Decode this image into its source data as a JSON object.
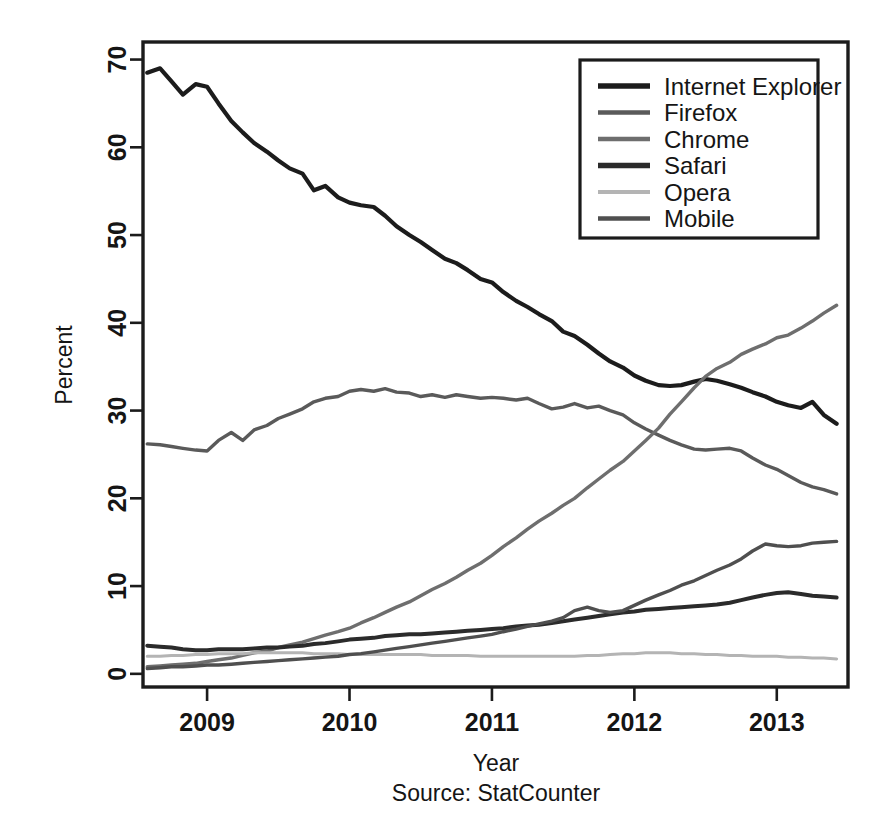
{
  "figure": {
    "source_note": "Source: StatCounter",
    "x_axis_title": "Year",
    "y_axis_title": "Percent"
  },
  "chart_data": {
    "type": "line",
    "title": "",
    "xlabel": "Year",
    "ylabel": "Percent",
    "subtitle": "Source: StatCounter",
    "xlim": [
      2008.55,
      2013.5
    ],
    "ylim": [
      -1.5,
      72
    ],
    "xticks": [
      2009,
      2010,
      2011,
      2012,
      2013
    ],
    "xticklabels": [
      "2009",
      "2010",
      "2011",
      "2012",
      "2013"
    ],
    "yticks": [
      0,
      10,
      20,
      30,
      40,
      50,
      60,
      70
    ],
    "yticklabels": [
      "0",
      "10",
      "20",
      "30",
      "40",
      "50",
      "60",
      "70"
    ],
    "grid": false,
    "legend_position": "top-right",
    "x": [
      2008.58,
      2008.67,
      2008.75,
      2008.83,
      2008.92,
      2009.0,
      2009.08,
      2009.17,
      2009.25,
      2009.33,
      2009.42,
      2009.5,
      2009.58,
      2009.67,
      2009.75,
      2009.83,
      2009.92,
      2010.0,
      2010.08,
      2010.17,
      2010.25,
      2010.33,
      2010.42,
      2010.5,
      2010.58,
      2010.67,
      2010.75,
      2010.83,
      2010.92,
      2011.0,
      2011.08,
      2011.17,
      2011.25,
      2011.33,
      2011.42,
      2011.5,
      2011.58,
      2011.67,
      2011.75,
      2011.83,
      2011.92,
      2012.0,
      2012.08,
      2012.17,
      2012.25,
      2012.33,
      2012.42,
      2012.5,
      2012.58,
      2012.67,
      2012.75,
      2012.83,
      2012.92,
      2013.0,
      2013.08,
      2013.17,
      2013.25,
      2013.33,
      2013.42
    ],
    "series": [
      {
        "name": "Internet Explorer",
        "color": "#1c1c1c",
        "width": 4.2,
        "values": [
          68.5,
          69.0,
          67.5,
          66.0,
          67.2,
          66.9,
          65.0,
          63.0,
          61.7,
          60.5,
          59.5,
          58.5,
          57.6,
          57.0,
          55.1,
          55.6,
          54.3,
          53.7,
          53.4,
          53.2,
          52.2,
          51.0,
          50.0,
          49.2,
          48.3,
          47.3,
          46.8,
          46.0,
          45.0,
          44.6,
          43.5,
          42.5,
          41.8,
          41.0,
          40.2,
          39.0,
          38.5,
          37.5,
          36.5,
          35.6,
          34.9,
          34.0,
          33.4,
          32.9,
          32.8,
          32.9,
          33.3,
          33.6,
          33.4,
          33.0,
          32.6,
          32.1,
          31.6,
          31.0,
          30.6,
          30.3,
          31.0,
          29.5,
          28.5
        ]
      },
      {
        "name": "Firefox",
        "color": "#5a5a5a",
        "width": 3.4,
        "values": [
          26.2,
          26.1,
          25.9,
          25.7,
          25.5,
          25.4,
          26.6,
          27.5,
          26.6,
          27.8,
          28.3,
          29.1,
          29.6,
          30.2,
          31.0,
          31.4,
          31.6,
          32.2,
          32.4,
          32.2,
          32.5,
          32.1,
          32.0,
          31.6,
          31.8,
          31.5,
          31.8,
          31.6,
          31.4,
          31.5,
          31.4,
          31.2,
          31.4,
          30.8,
          30.2,
          30.4,
          30.8,
          30.3,
          30.5,
          30.0,
          29.5,
          28.6,
          27.9,
          27.2,
          26.6,
          26.1,
          25.6,
          25.5,
          25.6,
          25.7,
          25.4,
          24.6,
          23.8,
          23.3,
          22.6,
          21.8,
          21.3,
          21.0,
          20.5
        ]
      },
      {
        "name": "Chrome",
        "color": "#6e6e6e",
        "width": 3.4,
        "values": [
          0.8,
          0.9,
          1.0,
          1.1,
          1.2,
          1.4,
          1.6,
          1.8,
          2.1,
          2.4,
          2.6,
          3.0,
          3.3,
          3.6,
          4.0,
          4.4,
          4.8,
          5.2,
          5.8,
          6.4,
          7.0,
          7.6,
          8.2,
          8.9,
          9.6,
          10.3,
          11.0,
          11.8,
          12.6,
          13.5,
          14.5,
          15.5,
          16.5,
          17.4,
          18.3,
          19.2,
          20.0,
          21.2,
          22.2,
          23.2,
          24.2,
          25.4,
          26.6,
          28.0,
          29.6,
          31.0,
          32.6,
          33.9,
          34.8,
          35.5,
          36.4,
          37.0,
          37.6,
          38.3,
          38.6,
          39.4,
          40.2,
          41.1,
          42.0
        ]
      },
      {
        "name": "Safari",
        "color": "#2b2b2b",
        "width": 4.0,
        "values": [
          3.2,
          3.1,
          3.0,
          2.8,
          2.7,
          2.7,
          2.8,
          2.8,
          2.8,
          2.9,
          3.0,
          3.0,
          3.1,
          3.2,
          3.4,
          3.5,
          3.7,
          3.9,
          4.0,
          4.1,
          4.3,
          4.4,
          4.5,
          4.5,
          4.6,
          4.7,
          4.8,
          4.9,
          5.0,
          5.1,
          5.2,
          5.4,
          5.5,
          5.6,
          5.8,
          6.0,
          6.2,
          6.4,
          6.6,
          6.8,
          7.0,
          7.1,
          7.3,
          7.4,
          7.5,
          7.6,
          7.7,
          7.8,
          7.9,
          8.1,
          8.4,
          8.7,
          9.0,
          9.2,
          9.3,
          9.1,
          8.9,
          8.8,
          8.7
        ]
      },
      {
        "name": "Opera",
        "color": "#b4b4b4",
        "width": 3.0,
        "values": [
          2.0,
          2.0,
          2.1,
          2.1,
          2.2,
          2.2,
          2.3,
          2.3,
          2.3,
          2.4,
          2.4,
          2.4,
          2.4,
          2.4,
          2.3,
          2.3,
          2.3,
          2.2,
          2.2,
          2.2,
          2.2,
          2.2,
          2.2,
          2.2,
          2.1,
          2.1,
          2.1,
          2.1,
          2.0,
          2.0,
          2.0,
          2.0,
          2.0,
          2.0,
          2.0,
          2.0,
          2.0,
          2.1,
          2.1,
          2.2,
          2.3,
          2.3,
          2.4,
          2.4,
          2.4,
          2.3,
          2.3,
          2.2,
          2.2,
          2.1,
          2.1,
          2.0,
          2.0,
          2.0,
          1.9,
          1.9,
          1.8,
          1.8,
          1.7
        ]
      },
      {
        "name": "Mobile",
        "color": "#4f4f4f",
        "width": 3.4,
        "values": [
          0.6,
          0.7,
          0.8,
          0.8,
          0.9,
          1.0,
          1.0,
          1.1,
          1.2,
          1.3,
          1.4,
          1.5,
          1.6,
          1.7,
          1.8,
          1.9,
          2.0,
          2.2,
          2.3,
          2.5,
          2.7,
          2.9,
          3.1,
          3.3,
          3.5,
          3.7,
          3.9,
          4.1,
          4.3,
          4.5,
          4.8,
          5.1,
          5.4,
          5.7,
          6.0,
          6.4,
          7.2,
          7.6,
          7.2,
          7.0,
          7.2,
          7.8,
          8.4,
          9.0,
          9.5,
          10.1,
          10.6,
          11.2,
          11.8,
          12.4,
          13.1,
          14.0,
          14.8,
          14.6,
          14.5,
          14.6,
          14.9,
          15.0,
          15.1
        ]
      }
    ]
  },
  "legend": {
    "items": [
      {
        "label": "Internet Explorer",
        "color": "#1c1c1c",
        "width": 5.6
      },
      {
        "label": "Firefox",
        "color": "#5a5a5a",
        "width": 4.4
      },
      {
        "label": "Chrome",
        "color": "#6e6e6e",
        "width": 4.4
      },
      {
        "label": "Safari",
        "color": "#2b2b2b",
        "width": 5.4
      },
      {
        "label": "Opera",
        "color": "#b4b4b4",
        "width": 4.0
      },
      {
        "label": "Mobile",
        "color": "#4f4f4f",
        "width": 4.6
      }
    ]
  }
}
